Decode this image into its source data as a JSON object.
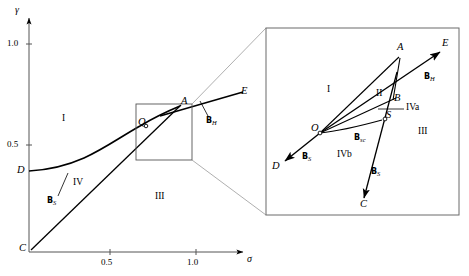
{
  "figure": {
    "type": "phase-diagram",
    "axes": {
      "x_label": "σ",
      "y_label": "γ",
      "x_ticks": [
        "0.5",
        "1.0"
      ],
      "y_ticks": [
        "0.5",
        "1.0"
      ]
    },
    "main_panel": {
      "points": [
        {
          "id": "C",
          "label": "C"
        },
        {
          "id": "D",
          "label": "D"
        },
        {
          "id": "Q",
          "label": "Q"
        },
        {
          "id": "A",
          "label": "A"
        },
        {
          "id": "E",
          "label": "E"
        }
      ],
      "regions": [
        {
          "label": "I"
        },
        {
          "label": "IV"
        },
        {
          "label": "III"
        }
      ],
      "curve_labels": [
        {
          "label": "B",
          "sub": "S"
        },
        {
          "label": "B",
          "sub": "H"
        }
      ]
    },
    "inset_panel": {
      "points": [
        {
          "id": "A",
          "label": "A"
        },
        {
          "id": "E",
          "label": "E"
        },
        {
          "id": "B",
          "label": "B"
        },
        {
          "id": "S",
          "label": "S"
        },
        {
          "id": "O",
          "label": "O"
        },
        {
          "id": "D",
          "label": "D"
        },
        {
          "id": "C",
          "label": "C"
        }
      ],
      "regions": [
        {
          "label": "I"
        },
        {
          "label": "II"
        },
        {
          "label": "III"
        },
        {
          "label": "IVa"
        },
        {
          "label": "IVb"
        }
      ],
      "curve_labels": [
        {
          "label": "B",
          "sub": "H"
        },
        {
          "label": "B",
          "sub": "S"
        },
        {
          "label": "B",
          "sub": "sc"
        },
        {
          "label": "B",
          "sub": "S"
        }
      ]
    },
    "colors": {
      "ink": "#000000",
      "thin_line": "#8a8a8a",
      "frame": "#6b6b6b",
      "background": "#ffffff"
    }
  }
}
